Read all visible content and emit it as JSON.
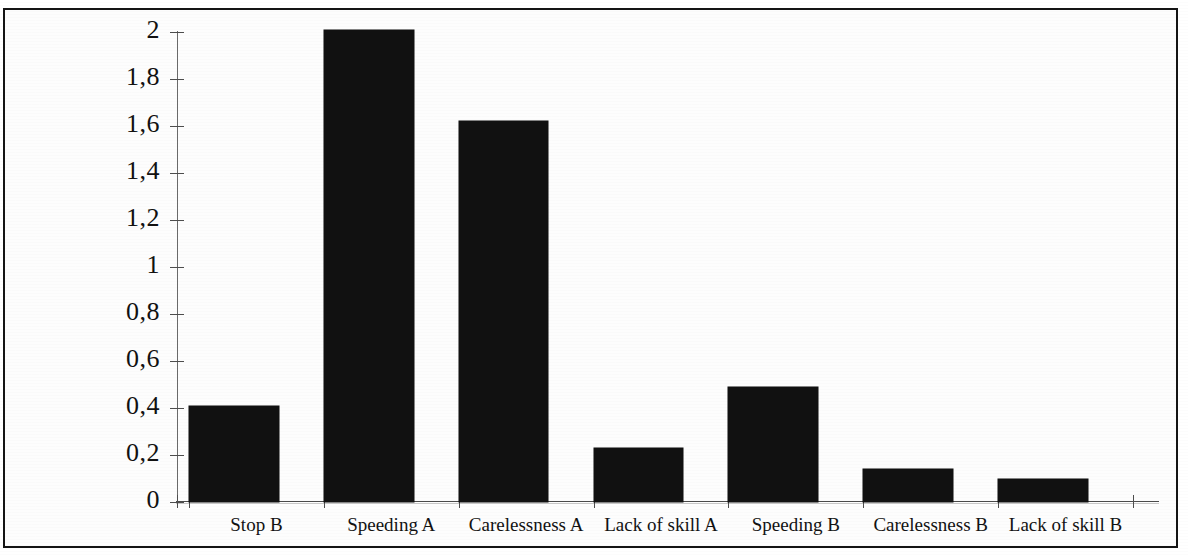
{
  "chart_data": {
    "type": "bar",
    "title": "",
    "subtitle": "",
    "xlabel": "",
    "ylabel": "",
    "categories": [
      "Stop B",
      "Speeding A",
      "Carelessness A",
      "Lack of skill A",
      "Speeding B",
      "Carelessness B",
      "Lack of skill B"
    ],
    "values": [
      0.41,
      2.01,
      1.62,
      0.23,
      0.49,
      0.14,
      0.1
    ],
    "ylim": [
      0,
      2
    ],
    "ytick_values": [
      0,
      0.2,
      0.4,
      0.6,
      0.8,
      1,
      1.2,
      1.4,
      1.6,
      1.8,
      2
    ],
    "ytick_labels": [
      "0",
      "0,2",
      "0,4",
      "0,6",
      "0,8",
      "1",
      "1,2",
      "1,4",
      "1,6",
      "1,8",
      "2"
    ],
    "decimal_separator": ",",
    "grid": false,
    "legend": null,
    "legend_position": "none",
    "bar_color": "#111111",
    "axis_color": "#4d4d4d",
    "background_color": "#ffffff",
    "annotations": []
  },
  "figure": {
    "border_color": "#141414",
    "has_outer_frame": true
  }
}
